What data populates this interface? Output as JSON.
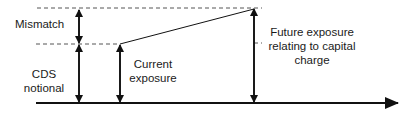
{
  "diagram": {
    "labels": {
      "mismatch": "Mismatch",
      "cds_notional_line1": "CDS",
      "cds_notional_line2": "notional",
      "current_exposure_line1": "Current",
      "current_exposure_line2": "exposure",
      "future_exposure_line1": "Future exposure",
      "future_exposure_line2": "relating to capital",
      "future_exposure_line3": "charge"
    },
    "colors": {
      "stroke": "#111111",
      "dashed": "#555555",
      "text": "#1a1a1a"
    }
  }
}
